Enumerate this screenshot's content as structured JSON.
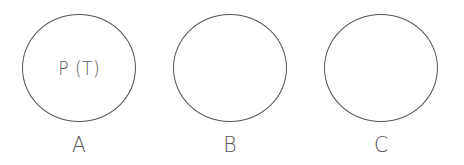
{
  "diagram": {
    "colors": {
      "stroke": "#555555",
      "text": "#5a5a5a",
      "background": "#ffffff"
    },
    "nodes": [
      {
        "id": "A",
        "label": "A",
        "content": "P (T)",
        "center_x": 79,
        "center_y": 68
      },
      {
        "id": "B",
        "label": "B",
        "content": "",
        "center_x": 230,
        "center_y": 68
      },
      {
        "id": "C",
        "label": "C",
        "content": "",
        "center_x": 381,
        "center_y": 68
      }
    ]
  }
}
